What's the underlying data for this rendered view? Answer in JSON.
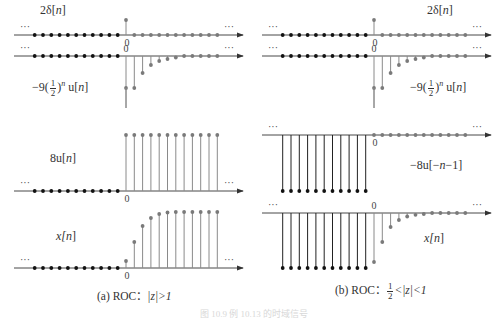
{
  "figure": {
    "panels": [
      {
        "id": "a",
        "caption_prefix": "(a) ROC：",
        "caption_condition": "|z|>1",
        "zero_x": 126,
        "rows": [
          {
            "label": "2δ[n]",
            "signal": "2delta",
            "axis_y": 35,
            "label_x": 38,
            "label_y": 5
          },
          {
            "label": "-9(1/2)^n u[n]",
            "signal": "neg9half",
            "axis_y": 56,
            "label_x": 30,
            "label_y": 78
          },
          {
            "label": "8u[n]",
            "signal": "8u",
            "axis_y": 191,
            "label_x": 50,
            "label_y": 150
          },
          {
            "label": "x[n]",
            "signal": "xa",
            "axis_y": 268,
            "label_x": 56,
            "label_y": 229
          }
        ]
      },
      {
        "id": "b",
        "caption_prefix": "(b) ROC：",
        "caption_condition": "<|z|<1",
        "zero_x": 374,
        "rows": [
          {
            "label": "2δ[n]",
            "signal": "2delta",
            "axis_y": 35,
            "label_x": 428,
            "label_y": 5
          },
          {
            "label": "-9(1/2)^n u[n]",
            "signal": "neg9half",
            "axis_y": 56,
            "label_x": 410,
            "label_y": 78
          },
          {
            "label": "-8u[-n-1]",
            "signal": "neg8u",
            "axis_y": 135,
            "label_x": 412,
            "label_y": 160
          },
          {
            "label": "x[n]",
            "signal": "xb",
            "axis_y": 213,
            "label_x": 424,
            "label_y": 232
          }
        ]
      }
    ],
    "text": {
      "delta_label_num": "2",
      "delta_label_fn": "δ[",
      "n": "n",
      "close": "]",
      "neg9": "−9",
      "half_num": "1",
      "half_den": "2",
      "exp_n": "n",
      "u_n": "u[",
      "eight_u": "8u[",
      "neg8u": "−8u[−",
      "neg8u_tail": "−1]",
      "x": "x[",
      "zero_tick": "0",
      "ellipsis": "···",
      "caption_a_prefix": "(a) ROC：",
      "caption_a_cond": "|z|>1",
      "caption_b_prefix": "(b) ROC：",
      "caption_b_half_num": "1",
      "caption_b_half_den": "2",
      "caption_b_cond": "<|z|<1",
      "figure_caption_faint": "图 10.9 例 10.13 的时域信号"
    },
    "colors": {
      "axis": "#333333",
      "neg_dots": "#111111",
      "pos_dots": "#7a7a7a",
      "neg_stems": "#222222",
      "pos_stems": "#8a8a8a"
    }
  },
  "chart_data": [
    {
      "type": "stem",
      "title": "(a) ROC: |z|>1",
      "xlabel": "n",
      "series": [
        {
          "name": "2δ[n]",
          "n": [
            0
          ],
          "values": [
            2
          ],
          "note": "zero elsewhere"
        },
        {
          "name": "-9(1/2)^n u[n]",
          "n": [
            0,
            1,
            2,
            3,
            4,
            5
          ],
          "values": [
            -9,
            -4.5,
            -2.25,
            -1.125,
            -0.5625,
            -0.28
          ]
        },
        {
          "name": "8u[n]",
          "n_range": [
            0,
            11
          ],
          "values_const": 8
        },
        {
          "name": "x[n] = 2δ[n] - 9(1/2)^n u[n] + 8u[n]",
          "n": [
            0,
            1,
            2,
            3,
            4,
            5
          ],
          "values": [
            1,
            3.5,
            5.75,
            6.875,
            7.4375,
            7.72
          ]
        }
      ]
    },
    {
      "type": "stem",
      "title": "(b) ROC: 1/2<|z|<1",
      "xlabel": "n",
      "series": [
        {
          "name": "2δ[n]",
          "n": [
            0
          ],
          "values": [
            2
          ]
        },
        {
          "name": "-9(1/2)^n u[n]",
          "n": [
            0,
            1,
            2,
            3,
            4,
            5
          ],
          "values": [
            -9,
            -4.5,
            -2.25,
            -1.125,
            -0.5625,
            -0.28
          ]
        },
        {
          "name": "-8u[-n-1]",
          "n_range": [
            -11,
            -1
          ],
          "values_const": -8
        },
        {
          "name": "x[n] = 2δ[n] - 9(1/2)^n u[n] - 8u[-n-1]",
          "n": [
            0,
            1,
            2,
            3,
            4,
            5
          ],
          "values": [
            -7,
            -4.5,
            -2.25,
            -1.125,
            -0.5625,
            -0.28
          ],
          "negative_n_value": -8
        }
      ]
    }
  ]
}
